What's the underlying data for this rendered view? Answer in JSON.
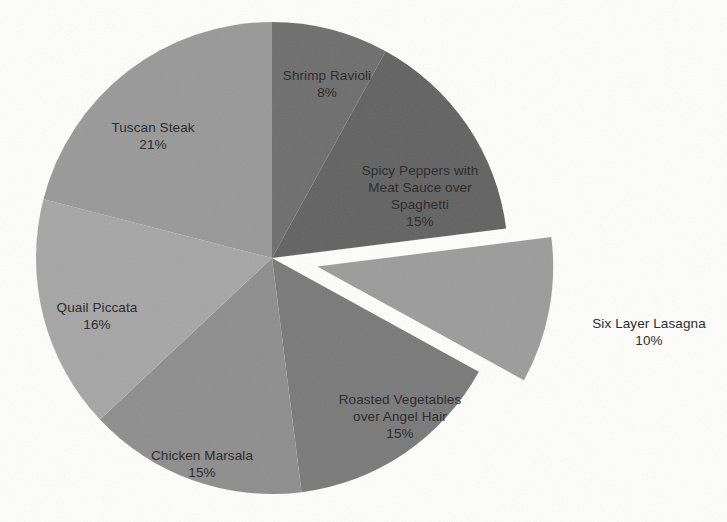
{
  "chart_data": {
    "type": "pie",
    "title": "",
    "xlabel": "",
    "ylabel": "",
    "categories": [
      "Shrimp Ravioli",
      "Spicy Peppers with Meat Sauce over Spaghetti",
      "Six Layer Lasagna",
      "Roasted Vegetables over Angel Hair",
      "Chicken Marsala",
      "Quail Piccata",
      "Tuscan Steak"
    ],
    "values": [
      8,
      15,
      10,
      15,
      15,
      16,
      21
    ],
    "value_unit": "percent",
    "start_angle_deg": 0,
    "direction": "clockwise",
    "exploded_slices": [
      "Six Layer Lasagna"
    ],
    "legend": "none",
    "labels_position": "inside-and-outside",
    "colors": [
      "#6f6f6f",
      "#636363",
      "#9c9c9c",
      "#7a7a7a",
      "#8e8e8e",
      "#a6a6a6",
      "#999999"
    ],
    "slices": [
      {
        "label": "Shrimp Ravioli",
        "percent_text": "8%",
        "value": 8,
        "color": "#6f6f6f",
        "exploded": false
      },
      {
        "label": "Spicy Peppers with\nMeat Sauce over\nSpaghetti",
        "percent_text": "15%",
        "value": 15,
        "color": "#636363",
        "exploded": false
      },
      {
        "label": "Six Layer Lasagna",
        "percent_text": "10%",
        "value": 10,
        "color": "#9c9c9c",
        "exploded": true
      },
      {
        "label": "Roasted Vegetables\nover Angel Hair",
        "percent_text": "15%",
        "value": 15,
        "color": "#7a7a7a",
        "exploded": false
      },
      {
        "label": "Chicken Marsala",
        "percent_text": "15%",
        "value": 15,
        "color": "#8e8e8e",
        "exploded": false
      },
      {
        "label": "Quail Piccata",
        "percent_text": "16%",
        "value": 16,
        "color": "#a6a6a6",
        "exploded": false
      },
      {
        "label": "Tuscan Steak",
        "percent_text": "21%",
        "value": 21,
        "color": "#999999",
        "exploded": false
      }
    ]
  },
  "labels": {
    "shrimp": {
      "name": "Shrimp Ravioli",
      "percent": "8%"
    },
    "spicy": {
      "name": "Spicy Peppers with\nMeat Sauce over\nSpaghetti",
      "percent": "15%"
    },
    "lasagna": {
      "name": "Six Layer Lasagna",
      "percent": "10%"
    },
    "roasted": {
      "name": "Roasted Vegetables\nover Angel Hair",
      "percent": "15%"
    },
    "chicken": {
      "name": "Chicken Marsala",
      "percent": "15%"
    },
    "quail": {
      "name": "Quail Piccata",
      "percent": "16%"
    },
    "tuscan": {
      "name": "Tuscan Steak",
      "percent": "21%"
    }
  },
  "background_color": "#fdfdfc",
  "text_color": "#2e2e2e"
}
